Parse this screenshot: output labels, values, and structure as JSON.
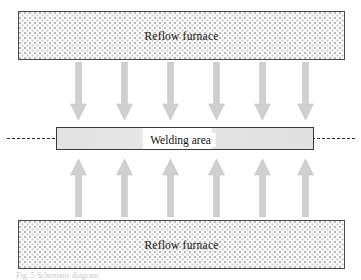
{
  "figure": {
    "type": "schematic-diagram",
    "furnace_top": {
      "label": "Reflow furnace"
    },
    "furnace_bottom": {
      "label": "Reflow furnace"
    },
    "welding_area": {
      "label": "Welding area"
    },
    "arrows": {
      "down_count": 6,
      "up_count": 6,
      "down_positions": [
        70,
        116,
        162,
        208,
        254,
        297
      ],
      "up_positions": [
        70,
        116,
        162,
        208,
        254,
        297
      ],
      "color": "#cfcfcf",
      "edge_color": "#bdbdbd"
    },
    "centerline": {
      "style": "dashed",
      "color": "#2b2b2b"
    },
    "caption": {
      "text": "Fig. 5  Schematic diagram"
    },
    "colors": {
      "furnace_fill": "#fbfbfb",
      "furnace_border": "#4a4a4a",
      "stipple_dot": "#b8b8b8",
      "bar_fill": "#e3e3e3",
      "bar_border": "#3a3a3a",
      "text": "#141414"
    }
  }
}
